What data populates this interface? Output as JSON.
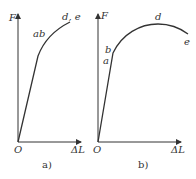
{
  "figure": {
    "panels": [
      {
        "id": "a",
        "caption": "a)",
        "y_axis_label": "F",
        "x_axis_label": "ΔL",
        "origin_label": "O",
        "point_labels": [
          "ab",
          "d, e"
        ]
      },
      {
        "id": "b",
        "caption": "b)",
        "y_axis_label": "F",
        "x_axis_label": "ΔL",
        "origin_label": "O",
        "point_labels": [
          "a",
          "b",
          "d",
          "e"
        ]
      }
    ],
    "colors": {
      "line": "#333333",
      "background": "#ffffff"
    }
  }
}
